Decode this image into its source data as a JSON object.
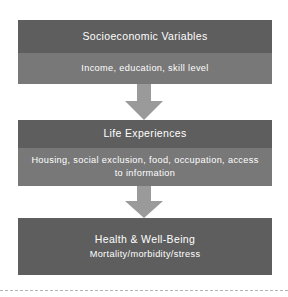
{
  "diagram": {
    "accent_dark": "#5e5e5e",
    "accent_light": "#787878",
    "arrow_color": "#9a9a9a",
    "text_color": "#ffffff",
    "background": "#ffffff",
    "nodes": [
      {
        "id": "socioeconomic",
        "title": "Socioeconomic Variables",
        "subtitle": "Income, education, skill level"
      },
      {
        "id": "life-experiences",
        "title": "Life Experiences",
        "subtitle": "Housing, social exclusion, food, occupation, access to information"
      },
      {
        "id": "health",
        "title": "Health & Well-Being",
        "subtitle": "Mortality/morbidity/stress"
      }
    ],
    "arrows": [
      {
        "id": "arrow-1",
        "from": "socioeconomic",
        "to": "life-experiences",
        "direction": "down"
      },
      {
        "id": "arrow-2",
        "from": "life-experiences",
        "to": "health",
        "direction": "down"
      }
    ]
  }
}
